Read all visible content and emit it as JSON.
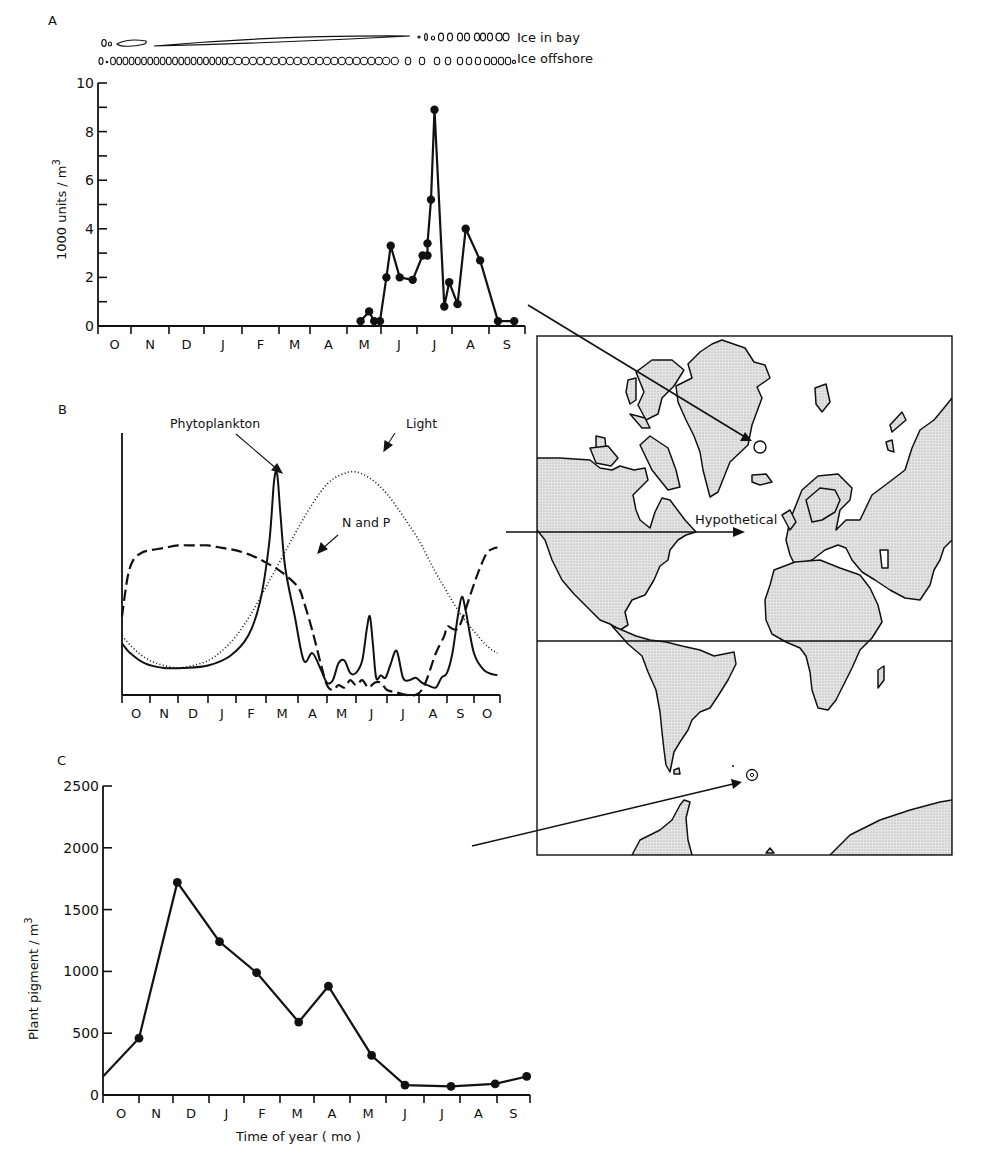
{
  "figure": {
    "panel_labels": {
      "a": "A",
      "b": "B",
      "c": "C"
    },
    "ice_labels": {
      "bay": "Ice in bay",
      "offshore": "Ice offshore"
    },
    "map_label": "Hypothetical"
  },
  "chart_data": [
    {
      "id": "A",
      "type": "line",
      "title": "A",
      "xlabel": "",
      "ylabel": "1000 units / m³",
      "ylabel_text": "1000 units / m",
      "ylabel_sup": "3",
      "ylim": [
        0,
        10
      ],
      "yticks": [
        0,
        2,
        4,
        6,
        8,
        10
      ],
      "xticks": [
        "O",
        "N",
        "D",
        "J",
        "F",
        "M",
        "A",
        "M",
        "J",
        "J",
        "A",
        "S"
      ],
      "grid": false,
      "points": [
        {
          "month_pos": 7.4,
          "y": 0.2
        },
        {
          "month_pos": 7.65,
          "y": 0.6
        },
        {
          "month_pos": 7.8,
          "y": 0.2
        },
        {
          "month_pos": 7.97,
          "y": 0.2
        },
        {
          "month_pos": 8.15,
          "y": 2.0
        },
        {
          "month_pos": 8.27,
          "y": 3.3
        },
        {
          "month_pos": 8.52,
          "y": 2.0
        },
        {
          "month_pos": 8.88,
          "y": 1.9
        },
        {
          "month_pos": 9.16,
          "y": 2.9
        },
        {
          "month_pos": 9.3,
          "y": 2.9
        },
        {
          "month_pos": 9.3,
          "y": 3.4
        },
        {
          "month_pos": 9.4,
          "y": 5.2
        },
        {
          "month_pos": 9.5,
          "y": 8.9
        },
        {
          "month_pos": 9.78,
          "y": 0.8
        },
        {
          "month_pos": 9.92,
          "y": 1.8
        },
        {
          "month_pos": 10.15,
          "y": 0.9
        },
        {
          "month_pos": 10.37,
          "y": 4.0
        },
        {
          "month_pos": 10.76,
          "y": 2.7
        },
        {
          "month_pos": 11.25,
          "y": 0.2
        },
        {
          "month_pos": 11.7,
          "y": 0.2
        }
      ]
    },
    {
      "id": "B",
      "type": "line",
      "title": "B",
      "xlabel": "",
      "ylabel": "",
      "xticks": [
        "O",
        "N",
        "D",
        "J",
        "F",
        "M",
        "A",
        "M",
        "J",
        "J",
        "A",
        "S",
        "O"
      ],
      "grid": false,
      "legend": [
        "Phytoplankton",
        "Light",
        "N and P"
      ],
      "note": "Hypothetical (relative, unitless) annual cycles",
      "series": [
        {
          "name": "Phytoplankton",
          "style": "solid",
          "x": [
            0,
            0.3,
            0.8,
            1.5,
            2.2,
            3,
            3.8,
            4.4,
            4.8,
            5.1,
            5.25,
            5.35,
            5.45,
            5.6,
            5.9,
            6.2,
            6.5,
            6.8,
            7.0,
            7.2,
            7.4,
            7.6,
            7.8,
            8.0,
            8.2,
            8.35,
            8.45,
            8.55,
            8.65,
            8.8,
            8.95,
            9.1,
            9.3,
            9.5,
            9.7,
            9.9,
            10.1,
            10.3,
            10.6,
            10.8,
            11.0,
            11.2,
            11.4,
            11.55,
            11.7,
            12.0,
            12.4,
            12.9
          ],
          "y": [
            0.19,
            0.15,
            0.11,
            0.09,
            0.09,
            0.1,
            0.14,
            0.22,
            0.36,
            0.6,
            0.85,
            0.88,
            0.72,
            0.5,
            0.3,
            0.12,
            0.15,
            0.08,
            0.03,
            0.04,
            0.11,
            0.12,
            0.07,
            0.07,
            0.12,
            0.25,
            0.3,
            0.18,
            0.05,
            0.06,
            0.05,
            0.1,
            0.16,
            0.05,
            0.04,
            0.05,
            0.03,
            0.02,
            0.01,
            0.05,
            0.07,
            0.15,
            0.3,
            0.38,
            0.32,
            0.15,
            0.08,
            0.06
          ]
        },
        {
          "name": "Light",
          "style": "dotted",
          "x": [
            0,
            0.5,
            1,
            1.5,
            2,
            2.5,
            3,
            3.5,
            4,
            4.5,
            5,
            5.5,
            6,
            6.5,
            7,
            7.5,
            8,
            8.5,
            9,
            9.5,
            10,
            10.5,
            11,
            11.5,
            12,
            12.5,
            12.9
          ],
          "y": [
            0.22,
            0.16,
            0.12,
            0.1,
            0.09,
            0.1,
            0.12,
            0.16,
            0.22,
            0.31,
            0.42,
            0.54,
            0.66,
            0.76,
            0.84,
            0.88,
            0.89,
            0.86,
            0.8,
            0.71,
            0.61,
            0.5,
            0.4,
            0.31,
            0.24,
            0.18,
            0.15
          ]
        },
        {
          "name": "N and P",
          "style": "dashed",
          "x": [
            0,
            0.2,
            0.4,
            0.7,
            1.0,
            1.5,
            2,
            2.5,
            3,
            3.5,
            4,
            4.5,
            5,
            5.5,
            6,
            6.2,
            6.5,
            6.8,
            7.0,
            7.2,
            7.4,
            7.6,
            7.8,
            8.0,
            8.2,
            8.4,
            8.6,
            8.8,
            9.0,
            9.3,
            9.6,
            9.9,
            10.1,
            10.3,
            10.6,
            10.9,
            11.0,
            11.2,
            11.4,
            11.6,
            11.9,
            12.2,
            12.5,
            12.8,
            12.9
          ],
          "y": [
            0.3,
            0.46,
            0.53,
            0.56,
            0.57,
            0.58,
            0.59,
            0.59,
            0.59,
            0.58,
            0.57,
            0.55,
            0.52,
            0.48,
            0.42,
            0.36,
            0.24,
            0.1,
            0.02,
            0.0,
            0.02,
            0.01,
            0.04,
            0.02,
            0.04,
            0.01,
            0.03,
            0.03,
            0.0,
            -0.01,
            -0.02,
            -0.02,
            0.0,
            0.05,
            0.15,
            0.22,
            0.26,
            0.25,
            0.25,
            0.3,
            0.4,
            0.49,
            0.56,
            0.58,
            0.58
          ]
        }
      ]
    },
    {
      "id": "C",
      "type": "line",
      "title": "C",
      "xlabel": "Time of year ( mo )",
      "ylabel": "Plant pigment / m³",
      "ylabel_text": "Plant pigment / m",
      "ylabel_sup": "3",
      "ylim": [
        0,
        2500
      ],
      "yticks": [
        0,
        500,
        1000,
        1500,
        2000,
        2500
      ],
      "xticks": [
        "O",
        "N",
        "D",
        "J",
        "F",
        "M",
        "A",
        "M",
        "J",
        "J",
        "A",
        "S"
      ],
      "grid": false,
      "points": [
        {
          "month_pos": 0.0,
          "y": 150,
          "marker": false
        },
        {
          "month_pos": 1.0,
          "y": 460
        },
        {
          "month_pos": 2.12,
          "y": 1720
        },
        {
          "month_pos": 3.3,
          "y": 1240
        },
        {
          "month_pos": 4.35,
          "y": 990
        },
        {
          "month_pos": 5.55,
          "y": 590
        },
        {
          "month_pos": 6.4,
          "y": 880
        },
        {
          "month_pos": 7.6,
          "y": 320
        },
        {
          "month_pos": 8.5,
          "y": 80
        },
        {
          "month_pos": 9.75,
          "y": 70
        },
        {
          "month_pos": 10.95,
          "y": 90
        },
        {
          "month_pos": 11.9,
          "y": 150
        }
      ]
    }
  ]
}
